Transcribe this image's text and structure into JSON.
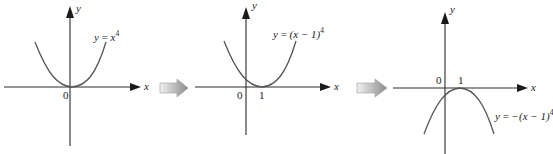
{
  "colors": {
    "axis": "#2a2a2a",
    "curve": "#555555",
    "arrow_light": "#e8e8e8",
    "arrow_dark": "#8a8a8a",
    "text": "#222222"
  },
  "panels": [
    {
      "id": "panel-1",
      "axis_x_label": "x",
      "axis_y_label": "y",
      "origin_label": "0",
      "equation": {
        "lhs": "y",
        "eq": "=",
        "base": "x",
        "exp": "4"
      },
      "ticks": []
    },
    {
      "id": "panel-2",
      "axis_x_label": "x",
      "axis_y_label": "y",
      "origin_label": "0",
      "equation": {
        "lhs": "y",
        "eq": "=",
        "base": "(x − 1)",
        "exp": "4"
      },
      "ticks": [
        "1"
      ]
    },
    {
      "id": "panel-3",
      "axis_x_label": "x",
      "axis_y_label": "y",
      "origin_label": "0",
      "equation": {
        "lhs": "y",
        "eq": "=",
        "base": "−(x − 1)",
        "exp": "4"
      },
      "ticks": [
        "1"
      ]
    }
  ],
  "transitions": [
    {
      "from": "panel-1",
      "to": "panel-2",
      "icon": "block-arrow-right-icon"
    },
    {
      "from": "panel-2",
      "to": "panel-3",
      "icon": "block-arrow-right-icon"
    }
  ]
}
